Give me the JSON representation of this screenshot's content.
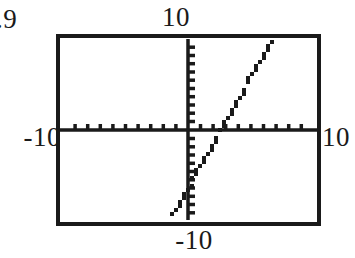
{
  "figure": {
    "kind": "graphing-calculator-screen",
    "ink_color": "#1a1a1a",
    "screen_background": "#ffffff"
  },
  "labels": {
    "corner_fragment": ".9",
    "y_max": "10",
    "x_min": "-10",
    "x_max": "10",
    "y_min": "-10"
  },
  "chart_data": {
    "type": "line",
    "title": "",
    "xlabel": "",
    "ylabel": "",
    "xlim": [
      -10,
      10
    ],
    "ylim": [
      -10,
      10
    ],
    "grid": false,
    "legend": null,
    "axes": {
      "x_axis_drawn": true,
      "y_axis_drawn": true,
      "x_tick_spacing": 1,
      "y_tick_spacing": 1,
      "x_tick_count": 20,
      "y_tick_count": 20,
      "tick_style": "short-marks-on-axis"
    },
    "x_tick_labels": [
      "-10",
      "10"
    ],
    "y_tick_labels": [
      "-10",
      "10"
    ],
    "series": [
      {
        "name": "y = 2.5x - 6.4",
        "slope": 2.5,
        "intercept": -6.4,
        "x_intercept": 2.56,
        "x": [
          -1.2,
          6.9
        ],
        "values": [
          -9.4,
          10.9
        ],
        "endpoints": [
          {
            "x": -1.2,
            "y": -9.4
          },
          {
            "x": 6.9,
            "y": 10.9
          }
        ],
        "style": "pixelated-staircase",
        "color": "#1a1a1a"
      }
    ],
    "annotations": []
  }
}
